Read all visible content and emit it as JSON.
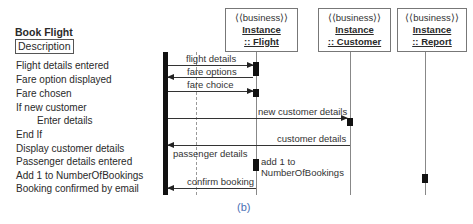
{
  "diagram": {
    "title": "Book Flight",
    "description_label": "Description",
    "steps": [
      {
        "text": "Flight details entered",
        "indent": false
      },
      {
        "text": "Fare option displayed",
        "indent": false
      },
      {
        "text": "Fare chosen",
        "indent": false
      },
      {
        "text": "If new customer",
        "indent": false
      },
      {
        "text": "Enter details",
        "indent": true
      },
      {
        "text": "End If",
        "indent": false
      },
      {
        "text": "Display customer details",
        "indent": false
      },
      {
        "text": "Passenger details entered",
        "indent": false
      },
      {
        "text": "Add 1 to NumberOfBookings",
        "indent": false
      },
      {
        "text": "Booking confirmed by email",
        "indent": false
      }
    ],
    "objects": [
      {
        "stereotype": "⟨⟨business⟩⟩",
        "name": "Instance",
        "class": ":: Flight"
      },
      {
        "stereotype": "⟨⟨business⟩⟩",
        "name": "Instance",
        "class": ":: Customer"
      },
      {
        "stereotype": "⟨⟨business⟩⟩",
        "name": "Instance",
        "class": ":: Report"
      }
    ],
    "messages": [
      {
        "label": "flight details",
        "from": "actor",
        "to": "Flight"
      },
      {
        "label": "fare options",
        "from": "Flight",
        "to": "actor"
      },
      {
        "label": "fare choice",
        "from": "actor",
        "to": "Flight"
      },
      {
        "label": "new customer details",
        "from": "actor",
        "to": "Customer"
      },
      {
        "label": "customer details",
        "from": "Customer",
        "to": "actor"
      },
      {
        "label": "passenger details",
        "from": "actor",
        "to": "Flight"
      },
      {
        "label": "add 1 to",
        "label2": "NumberOfBookings",
        "from": "Flight",
        "to": "Report"
      },
      {
        "label": "confirm booking",
        "from": "Flight",
        "to": "actor"
      }
    ],
    "caption": "(b)"
  }
}
